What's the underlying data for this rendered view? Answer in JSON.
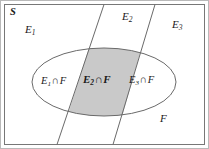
{
  "figure": {
    "name": "venn-diagram-partition",
    "width": 209,
    "height": 149
  },
  "colors": {
    "background": "#ffffff",
    "stroke": "#5a5a5a",
    "outer_frame": "#b9b9b9",
    "shaded_fill": "#c9c9c9",
    "text": "#1a1a1a"
  },
  "labels": {
    "sample_space": "S",
    "event_1": "E",
    "event_1_sub": "1",
    "event_2": "E",
    "event_2_sub": "2",
    "event_3": "E",
    "event_3_sub": "3",
    "intersect_symbol": "∩",
    "f_set": "F",
    "e1_int_f_lead": "E",
    "e1_int_f_sub": "1",
    "e1_int_f_tail": "F",
    "e2_int_f_lead": "E",
    "e2_int_f_sub": "2",
    "e2_int_f_tail": "F",
    "e3_int_f_lead": "E",
    "e3_int_f_sub": "3",
    "e3_int_f_tail": "F"
  },
  "geometry": {
    "inner_rect": {
      "x": 4,
      "y": 4,
      "width": 201,
      "height": 141
    },
    "divider_left": {
      "x1": 104,
      "y1": 4,
      "x2": 57,
      "y2": 145
    },
    "divider_right": {
      "x1": 155,
      "y1": 4,
      "x2": 113,
      "y2": 145
    },
    "ellipse": {
      "cx": 104,
      "cy": 82,
      "rx": 72,
      "ry": 34
    }
  }
}
